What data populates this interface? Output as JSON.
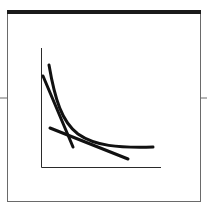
{
  "diagram": {
    "type": "convex curve with two tangent/secant lines",
    "colors": {
      "frame": "#6a6a6a",
      "top_bar": "#1a1a1a",
      "axes": "#2a2a2a",
      "curve": "#111111",
      "background": "#ffffff"
    },
    "frame": {
      "x": 7,
      "y": 10,
      "width": 193,
      "height": 191,
      "top_bar_height": 4
    },
    "side_rules": {
      "y": 98,
      "left_x1": 0,
      "left_x2": 7,
      "right_x1": 200,
      "right_x2": 207
    },
    "axes": {
      "origin": [
        41,
        167
      ],
      "y_top": 48,
      "x_right": 161
    },
    "curve": {
      "path": "M49,65 C55,100 62,122 78,134 C95,146 118,148 153,147"
    },
    "lines": [
      {
        "name": "steep-line",
        "x1": 43,
        "y1": 76,
        "x2": 73,
        "y2": 147
      },
      {
        "name": "shallow-line",
        "x1": 50,
        "y1": 128,
        "x2": 128,
        "y2": 159
      }
    ]
  }
}
